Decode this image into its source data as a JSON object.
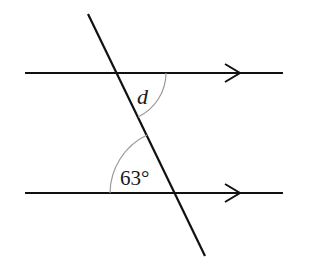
{
  "diagram": {
    "angle_labels": {
      "unknown": "d",
      "known": "63°"
    },
    "colors": {
      "line": "#111111",
      "arc": "#999999",
      "background": "#ffffff"
    }
  }
}
